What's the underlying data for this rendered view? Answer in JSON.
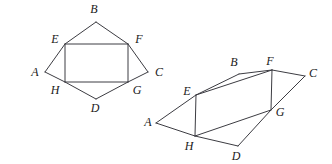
{
  "figure": {
    "background_color": "#ffffff",
    "stroke_color": "#3c3c42",
    "label_color": "#1a1a1a"
  },
  "diagrams": [
    {
      "name": "left-figure",
      "description": "Kite ABCD with inscribed rectangle EFGH",
      "vertices": {
        "A": {
          "x": 45,
          "y": 72,
          "label": "A",
          "label_x": 35,
          "label_y": 73
        },
        "B": {
          "x": 96,
          "y": 22,
          "label": "B",
          "label_x": 94,
          "label_y": 10
        },
        "C": {
          "x": 148,
          "y": 72,
          "label": "C",
          "label_x": 159,
          "label_y": 73
        },
        "D": {
          "x": 96,
          "y": 99,
          "label": "D",
          "label_x": 95,
          "label_y": 109
        },
        "E": {
          "x": 65,
          "y": 44,
          "label": "E",
          "label_x": 55,
          "label_y": 40
        },
        "F": {
          "x": 128,
          "y": 44,
          "label": "F",
          "label_x": 139,
          "label_y": 40
        },
        "G": {
          "x": 128,
          "y": 82,
          "label": "G",
          "label_x": 137,
          "label_y": 91
        },
        "H": {
          "x": 65,
          "y": 82,
          "label": "H",
          "label_x": 55,
          "label_y": 91
        }
      },
      "edges": [
        [
          "A",
          "E"
        ],
        [
          "E",
          "B"
        ],
        [
          "B",
          "F"
        ],
        [
          "F",
          "C"
        ],
        [
          "C",
          "G"
        ],
        [
          "G",
          "D"
        ],
        [
          "D",
          "H"
        ],
        [
          "H",
          "A"
        ],
        [
          "E",
          "F"
        ],
        [
          "F",
          "G"
        ],
        [
          "G",
          "H"
        ],
        [
          "H",
          "E"
        ]
      ]
    },
    {
      "name": "right-figure",
      "description": "Skewed quadrilateral ABCD with inscribed parallelogram EFGH",
      "vertices": {
        "A": {
          "x": 156,
          "y": 123,
          "label": "A",
          "label_x": 148,
          "label_y": 123
        },
        "B": {
          "x": 239,
          "y": 74,
          "label": "B",
          "label_x": 234,
          "label_y": 63
        },
        "C": {
          "x": 305,
          "y": 76,
          "label": "C",
          "label_x": 313,
          "label_y": 74
        },
        "D": {
          "x": 238,
          "y": 146,
          "label": "D",
          "label_x": 236,
          "label_y": 157
        },
        "E": {
          "x": 196,
          "y": 95,
          "label": "E",
          "label_x": 187,
          "label_y": 92
        },
        "F": {
          "x": 272,
          "y": 70,
          "label": "F",
          "label_x": 270,
          "label_y": 62
        },
        "G": {
          "x": 271,
          "y": 110,
          "label": "G",
          "label_x": 280,
          "label_y": 113
        },
        "H": {
          "x": 195,
          "y": 136,
          "label": "H",
          "label_x": 189,
          "label_y": 147
        }
      },
      "edges": [
        [
          "A",
          "E"
        ],
        [
          "E",
          "B"
        ],
        [
          "B",
          "F"
        ],
        [
          "F",
          "C"
        ],
        [
          "C",
          "G"
        ],
        [
          "G",
          "D"
        ],
        [
          "D",
          "H"
        ],
        [
          "H",
          "A"
        ],
        [
          "E",
          "F"
        ],
        [
          "F",
          "G"
        ],
        [
          "G",
          "H"
        ],
        [
          "H",
          "E"
        ]
      ]
    }
  ]
}
